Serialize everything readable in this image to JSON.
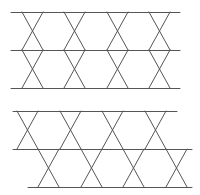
{
  "diagram": {
    "stroke_color": "#555555",
    "background": "#ffffff",
    "figures": [
      {
        "name": "top-figure",
        "horizontal_lines": [
          {
            "x1": 11,
            "x2": 180,
            "y": 12
          },
          {
            "x1": 11,
            "x2": 180,
            "y": 50
          },
          {
            "x1": 11,
            "x2": 180,
            "y": 88
          }
        ],
        "segments": [
          [
            22,
            12,
            43,
            50
          ],
          [
            43,
            12,
            22,
            50
          ],
          [
            22,
            50,
            43,
            88
          ],
          [
            43,
            50,
            22,
            88
          ],
          [
            64,
            12,
            85,
            50
          ],
          [
            85,
            12,
            64,
            50
          ],
          [
            64,
            50,
            85,
            88
          ],
          [
            85,
            50,
            64,
            88
          ],
          [
            107,
            12,
            128,
            50
          ],
          [
            128,
            12,
            107,
            50
          ],
          [
            107,
            50,
            128,
            88
          ],
          [
            128,
            50,
            107,
            88
          ],
          [
            149,
            12,
            170,
            50
          ],
          [
            170,
            12,
            149,
            50
          ],
          [
            149,
            50,
            170,
            88
          ],
          [
            170,
            50,
            149,
            88
          ]
        ]
      },
      {
        "name": "bottom-figure",
        "horizontal_lines": [
          {
            "x1": 13,
            "x2": 177,
            "y": 111
          },
          {
            "x1": 13,
            "x2": 192,
            "y": 149
          },
          {
            "x1": 28,
            "x2": 192,
            "y": 187
          }
        ],
        "segments": [
          [
            17,
            111,
            38,
            149
          ],
          [
            38,
            111,
            17,
            149
          ],
          [
            60,
            111,
            81,
            149
          ],
          [
            81,
            111,
            60,
            149
          ],
          [
            102,
            111,
            123,
            149
          ],
          [
            123,
            111,
            102,
            149
          ],
          [
            145,
            111,
            166,
            149
          ],
          [
            166,
            111,
            145,
            149
          ],
          [
            38,
            149,
            59,
            187
          ],
          [
            59,
            149,
            38,
            187
          ],
          [
            81,
            149,
            102,
            187
          ],
          [
            102,
            149,
            81,
            187
          ],
          [
            123,
            149,
            144,
            187
          ],
          [
            144,
            149,
            123,
            187
          ],
          [
            166,
            149,
            187,
            187
          ],
          [
            187,
            149,
            166,
            187
          ]
        ]
      }
    ]
  }
}
